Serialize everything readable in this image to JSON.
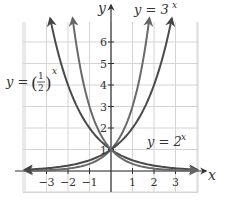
{
  "chart_data": {
    "type": "line",
    "title": "",
    "xlabel": "x",
    "ylabel": "y",
    "xlim": [
      -4,
      4
    ],
    "ylim": [
      -1,
      7
    ],
    "grid": true,
    "x_ticks": [
      "−3",
      "−2",
      "−1",
      "1",
      "2",
      "3"
    ],
    "y_ticks": [
      "1",
      "2",
      "3",
      "4",
      "5",
      "6"
    ],
    "series": [
      {
        "name": "y = 3^x",
        "label_base": "y = 3",
        "label_exp": "x",
        "color": "#666666",
        "x": [
          -3,
          -2,
          -1,
          0,
          1,
          1.77
        ],
        "values": [
          0.037,
          0.111,
          0.333,
          1,
          3,
          7
        ]
      },
      {
        "name": "y = 2^x",
        "label_base": "y = 2",
        "label_exp": "x",
        "color": "#444444",
        "x": [
          -3.5,
          -3,
          -2,
          -1,
          0,
          1,
          2,
          2.81
        ],
        "values": [
          0.088,
          0.125,
          0.25,
          0.5,
          1,
          2,
          4,
          7
        ]
      },
      {
        "name": "y = (1/2)^x",
        "label_base": "y =",
        "label_frac_num": "1",
        "label_frac_den": "2",
        "label_exp": "x",
        "color": "#444444",
        "x": [
          -2.81,
          -2,
          -1,
          0,
          1,
          2,
          3,
          3.5
        ],
        "values": [
          7,
          4,
          2,
          1,
          0.5,
          0.25,
          0.125,
          0.088
        ]
      },
      {
        "name": "y = (1/3)^x",
        "color": "#666666",
        "x": [
          -1.77,
          -1,
          0,
          1,
          2,
          3
        ],
        "values": [
          7,
          3,
          1,
          0.333,
          0.111,
          0.037
        ]
      }
    ],
    "annotations": [
      "y = 3^x",
      "y = 2^x",
      "y = (1/2)^x"
    ]
  },
  "axes": {
    "x_label": "x",
    "y_label": "y"
  },
  "labels": {
    "three_x": {
      "base": "y = 3",
      "exp": "x"
    },
    "two_x": {
      "base": "y = 2",
      "exp": "x"
    },
    "half_x": {
      "prefix": "y =",
      "num": "1",
      "den": "2",
      "exp": "x"
    }
  }
}
